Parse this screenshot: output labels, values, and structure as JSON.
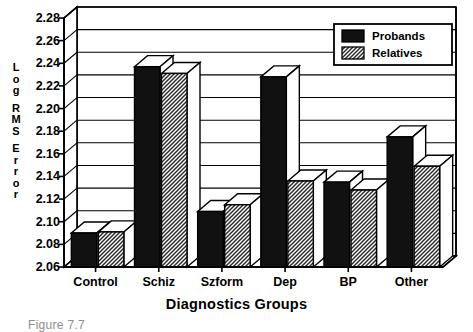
{
  "chart_data": {
    "type": "bar",
    "title": "",
    "subtitle": "",
    "xlabel": "Diagnostics Groups",
    "ylabel": "Log RMS Error",
    "categories": [
      "Control",
      "Schiz",
      "Szform",
      "Dep",
      "BP",
      "Other"
    ],
    "series": [
      {
        "name": "Probands",
        "values": [
          2.09,
          2.237,
          2.109,
          2.228,
          2.135,
          2.175
        ],
        "color": "#111111",
        "fill": "solid"
      },
      {
        "name": "Relatives",
        "values": [
          2.091,
          2.231,
          2.115,
          2.136,
          2.128,
          2.149
        ],
        "color": "#9a9a9a",
        "fill": "hatch"
      }
    ],
    "ylim": [
      2.06,
      2.28
    ],
    "ytick_step": 0.02,
    "yticks": [
      "2.28",
      "2.26",
      "2.24",
      "2.22",
      "2.20",
      "2.18",
      "2.16",
      "2.14",
      "2.12",
      "2.10",
      "2.08",
      "2.06"
    ],
    "ytick_values": [
      2.28,
      2.26,
      2.24,
      2.22,
      2.2,
      2.18,
      2.16,
      2.14,
      2.12,
      2.1,
      2.08,
      2.06
    ],
    "grid": true,
    "grid_axis": "y",
    "legend": {
      "position": "top-right",
      "entries": [
        {
          "label": "Probands",
          "swatch": "solid-black"
        },
        {
          "label": "Relatives",
          "swatch": "hatched-gray"
        }
      ]
    },
    "style": "3d-bars",
    "plot_background": "#ffffff"
  },
  "ylabel_letters": [
    "L",
    "o",
    "g",
    "",
    "R",
    "M",
    "S",
    "",
    "E",
    "r",
    "r",
    "o",
    "r"
  ],
  "caption": "Figure 7.7"
}
